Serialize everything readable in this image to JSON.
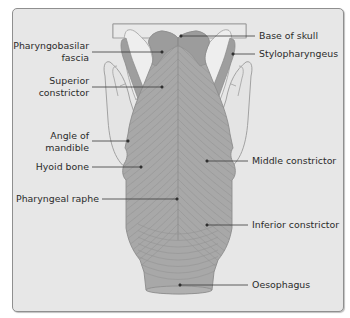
{
  "figure": {
    "colors": {
      "panel_background": "#e7e7e7",
      "panel_border": "#8f8f8f",
      "muscle_fill": "#a8a8a8",
      "muscle_dark": "#969696",
      "bone_fill": "#dcdcdc",
      "outline": "#8a8a8a",
      "leader_line": "#3a3a3a",
      "text": "#2b2b2b"
    },
    "labels_left": [
      {
        "id": "pharyngobasilar-fascia",
        "lines": [
          "Pharyngobasilar",
          "fascia"
        ]
      },
      {
        "id": "superior-constrictor",
        "lines": [
          "Superior",
          "constrictor"
        ]
      },
      {
        "id": "angle-of-mandible",
        "lines": [
          "Angle of",
          "mandible"
        ]
      },
      {
        "id": "hyoid-bone",
        "lines": [
          "Hyoid bone"
        ]
      },
      {
        "id": "pharyngeal-raphe",
        "lines": [
          "Pharyngeal raphe"
        ]
      }
    ],
    "labels_right": [
      {
        "id": "base-of-skull",
        "lines": [
          "Base of skull"
        ]
      },
      {
        "id": "stylopharyngeus",
        "lines": [
          "Stylopharyngeus"
        ]
      },
      {
        "id": "middle-constrictor",
        "lines": [
          "Middle constrictor"
        ]
      },
      {
        "id": "inferior-constrictor",
        "lines": [
          "Inferior constrictor"
        ]
      },
      {
        "id": "oesophagus",
        "lines": [
          "Oesophagus"
        ]
      }
    ]
  }
}
